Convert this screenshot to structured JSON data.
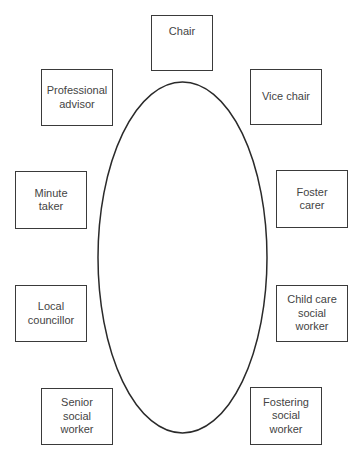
{
  "diagram": {
    "title": "",
    "table": {
      "shape": "ellipse",
      "cx": 182.5,
      "cy": 257.5,
      "rx": 84.5,
      "ry": 175.5,
      "stroke": "#2a2a2a"
    },
    "seats": [
      {
        "id": "chair",
        "label": "Chair",
        "x": 151,
        "y": 15,
        "w": 62,
        "h": 56,
        "align": "top"
      },
      {
        "id": "professional-advisor",
        "label": "Professional advisor",
        "x": 41,
        "y": 69,
        "w": 72,
        "h": 57
      },
      {
        "id": "vice-chair",
        "label": "Vice chair",
        "x": 250,
        "y": 69,
        "w": 72,
        "h": 56
      },
      {
        "id": "minute-taker",
        "label": "Minute taker",
        "x": 15,
        "y": 171,
        "w": 72,
        "h": 58
      },
      {
        "id": "foster-carer",
        "label": "Foster carer",
        "x": 276,
        "y": 170,
        "w": 72,
        "h": 58
      },
      {
        "id": "local-councillor",
        "label": "Local councillor",
        "x": 15,
        "y": 285,
        "w": 72,
        "h": 57
      },
      {
        "id": "child-care-social-worker",
        "label": "Child care social worker",
        "x": 276,
        "y": 285,
        "w": 72,
        "h": 57
      },
      {
        "id": "senior-social-worker",
        "label": "Senior social worker",
        "x": 41,
        "y": 388,
        "w": 72,
        "h": 57
      },
      {
        "id": "fostering-social-worker",
        "label": "Fostering social worker",
        "x": 250,
        "y": 387,
        "w": 72,
        "h": 58
      }
    ]
  },
  "labels": {
    "chair": "Chair",
    "professional_advisor_1": "Professional",
    "professional_advisor_2": "advisor",
    "vice_chair": "Vice chair",
    "minute_taker_1": "Minute",
    "minute_taker_2": "taker",
    "foster_carer_1": "Foster",
    "foster_carer_2": "carer",
    "local_councillor_1": "Local",
    "local_councillor_2": "councillor",
    "child_care_1": "Child care",
    "child_care_2": "social",
    "child_care_3": "worker",
    "senior_1": "Senior",
    "senior_2": "social",
    "senior_3": "worker",
    "fostering_1": "Fostering",
    "fostering_2": "social",
    "fostering_3": "worker"
  }
}
